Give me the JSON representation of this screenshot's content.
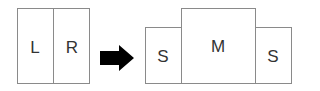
{
  "before": {
    "panels": [
      {
        "label": "L"
      },
      {
        "label": "R"
      }
    ]
  },
  "arrow": {
    "icon": "right-arrow-icon",
    "color": "#000000"
  },
  "after": {
    "panels": [
      {
        "label": "S"
      },
      {
        "label": "M"
      },
      {
        "label": "S"
      }
    ]
  },
  "colors": {
    "border": "#8a8a8a",
    "text": "#333333"
  }
}
